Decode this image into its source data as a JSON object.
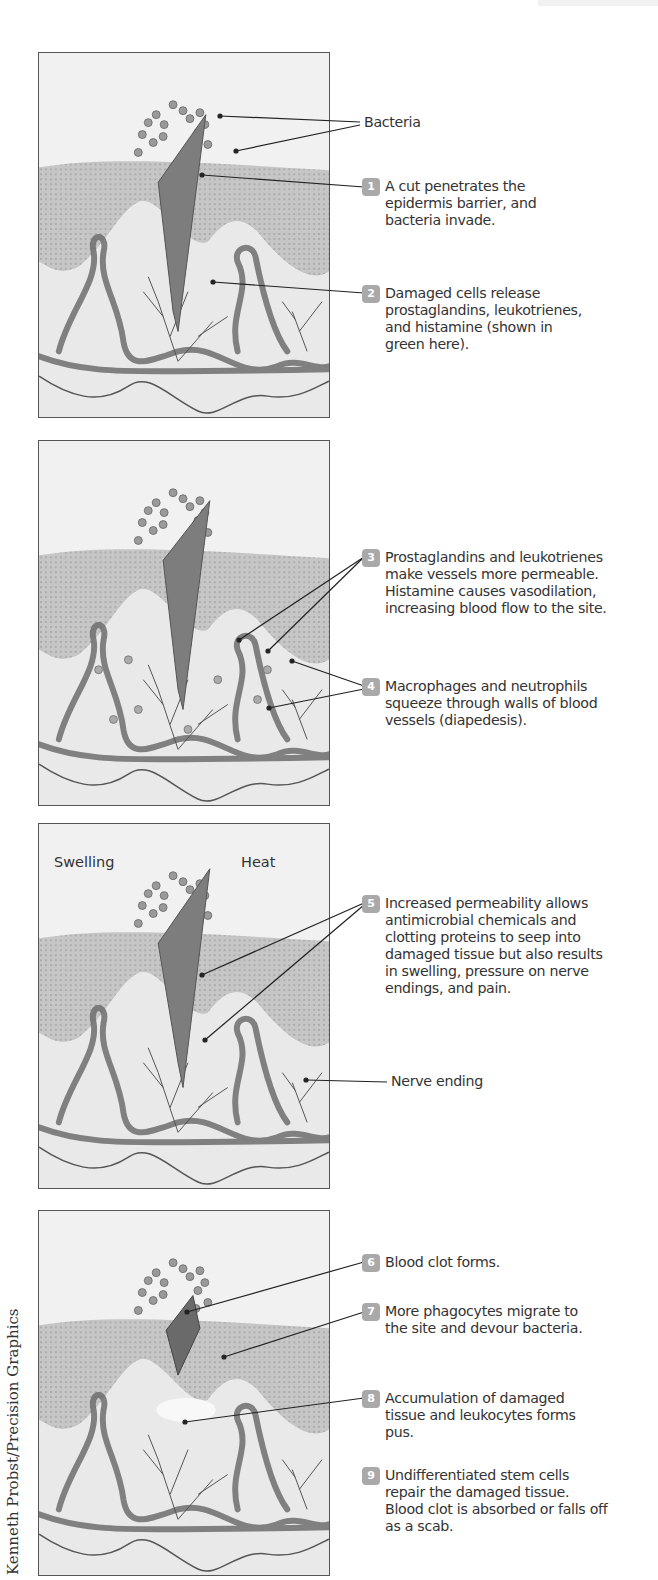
{
  "figure": {
    "credit": "Kenneth Probst/Precision Graphics",
    "panels": [
      {
        "id": 1,
        "labels": [
          {
            "text": "Bacteria"
          }
        ],
        "steps": [
          {
            "num": "1",
            "text": "A cut penetrates the epidermis barrier, and bacteria invade."
          },
          {
            "num": "2",
            "text": "Damaged cells release prostaglandins, leukotrienes, and histamine (shown in green here)."
          }
        ]
      },
      {
        "id": 2,
        "steps": [
          {
            "num": "3",
            "text": "Prostaglandins and leukotrienes make vessels more permeable. Histamine causes vasodilation, increasing blood flow to the site."
          },
          {
            "num": "4",
            "text": "Macrophages and neutrophils squeeze through walls of blood vessels (diapedesis)."
          }
        ]
      },
      {
        "id": 3,
        "inside_labels": {
          "left": "Swelling",
          "right": "Heat"
        },
        "labels": [
          {
            "text": "Nerve ending"
          }
        ],
        "steps": [
          {
            "num": "5",
            "text": "Increased permeability allows antimicrobial chemicals and clotting proteins to seep into damaged tissue but also results in swelling, pressure on nerve endings, and pain."
          }
        ]
      },
      {
        "id": 4,
        "steps": [
          {
            "num": "6",
            "text": "Blood clot forms."
          },
          {
            "num": "7",
            "text": "More phagocytes migrate to the site and devour bacteria."
          },
          {
            "num": "8",
            "text": "Accumulation of damaged tissue and leukocytes forms pus."
          },
          {
            "num": "9",
            "text": "Undifferentiated stem cells repair the damaged tissue. Blood clot is absorbed or falls off as a scab."
          }
        ]
      }
    ]
  },
  "colors": {
    "badge": "#a9a9a9",
    "text": "#333333",
    "border": "#555555",
    "tissue_dark": "#8a8a8a",
    "vessel": "#6e6e6e"
  }
}
